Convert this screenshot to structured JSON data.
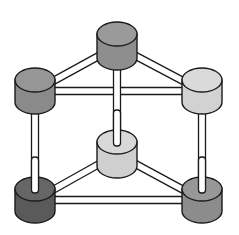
{
  "diagram": {
    "type": "triangular-prism-network",
    "background": "#ffffff",
    "stroke": "#1a1a1a",
    "rod_fill": "#ffffff",
    "nodes": [
      {
        "id": "top-back",
        "cx": 117,
        "cy": 34,
        "rx": 20,
        "ry": 12,
        "h": 24,
        "fill": "#8e8e8e",
        "top_fill": "#9a9a9a"
      },
      {
        "id": "top-left",
        "cx": 35,
        "cy": 80,
        "rx": 20,
        "ry": 12,
        "h": 22,
        "fill": "#8a8a8a",
        "top_fill": "#969696"
      },
      {
        "id": "top-right",
        "cx": 202,
        "cy": 80,
        "rx": 20,
        "ry": 12,
        "h": 22,
        "fill": "#d2d2d2",
        "top_fill": "#dadada"
      },
      {
        "id": "bottom-back",
        "cx": 117,
        "cy": 142,
        "rx": 20,
        "ry": 12,
        "h": 24,
        "fill": "#cfcfcf",
        "top_fill": "#d8d8d8"
      },
      {
        "id": "bottom-left",
        "cx": 35,
        "cy": 189,
        "rx": 20,
        "ry": 12,
        "h": 22,
        "fill": "#5a5a5a",
        "top_fill": "#666666"
      },
      {
        "id": "bottom-right",
        "cx": 202,
        "cy": 189,
        "rx": 20,
        "ry": 12,
        "h": 22,
        "fill": "#8c8c8c",
        "top_fill": "#979797"
      }
    ],
    "edges": [
      {
        "from": "top-back",
        "to": "top-left"
      },
      {
        "from": "top-back",
        "to": "top-right"
      },
      {
        "from": "top-left",
        "to": "top-right"
      },
      {
        "from": "bottom-back",
        "to": "bottom-left"
      },
      {
        "from": "bottom-back",
        "to": "bottom-right"
      },
      {
        "from": "bottom-left",
        "to": "bottom-right"
      },
      {
        "from": "top-back",
        "to": "bottom-back"
      },
      {
        "from": "top-left",
        "to": "bottom-left"
      },
      {
        "from": "top-right",
        "to": "bottom-right"
      }
    ]
  }
}
